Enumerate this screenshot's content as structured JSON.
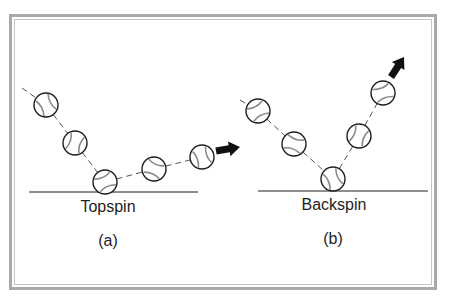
{
  "figure": {
    "panels": [
      {
        "id": "a",
        "title": "Topspin",
        "caption": "(a)",
        "ground": {
          "x1": 29,
          "x2": 198,
          "y": 192
        },
        "balls": [
          [
            46,
            105
          ],
          [
            75,
            143
          ],
          [
            105,
            182
          ],
          [
            154,
            169
          ],
          [
            202,
            157
          ]
        ],
        "arrow": {
          "from": [
            216,
            151
          ],
          "to": [
            240,
            147
          ]
        },
        "trail_start": [
          22,
          88
        ]
      },
      {
        "id": "b",
        "title": "Backspin",
        "caption": "(b)",
        "ground": {
          "x1": 258,
          "x2": 428,
          "y": 191
        },
        "balls": [
          [
            258,
            111
          ],
          [
            294,
            144
          ],
          [
            333,
            179
          ],
          [
            359,
            136
          ],
          [
            383,
            93
          ]
        ],
        "arrow": {
          "from": [
            391,
            77
          ],
          "to": [
            404,
            57
          ]
        },
        "trail_start": [
          240,
          100
        ]
      }
    ],
    "colors": {
      "frame": "#a9a9a9",
      "ink": "#1e1e1e",
      "seam": "#8a8a8a",
      "trail": "#555555"
    }
  }
}
